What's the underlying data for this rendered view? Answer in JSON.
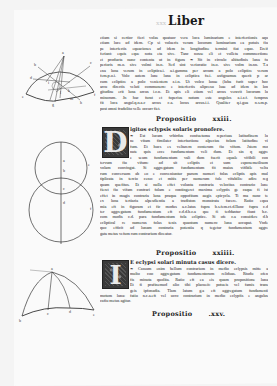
{
  "page": {
    "running_header": "Liber",
    "folio_ghost": "xxx"
  },
  "blocks": [
    {
      "id": "prop-xxii-tail",
      "lines": [
        "etiam si certior fieri volas quatuor vera loca luminarium e interfectionis aqu",
        "etiam luce ad idem. Cp si volueris veram locorum luminarium ea potuis fiu",
        "pe interfectis equaciones ad idem in longitudine termini fiat equo. Ereif",
        "feriant: equis eque nota eta sive. Tanc nosse eli et volleta commnectione",
        "et producta nunc contenta ut in figura ❧ Sit in circulo altitudinis luna fu",
        "perioris m.o. sive volmi in.n. Sed sint verioratio in.o. sive volm in.nn. T.a",
        "ena luna verum in ecliptica.i. a.i.gamma per arcum a polo ecliptice verum",
        "fem.p.o.i. Volo autem lune luna in ecliptica fu.i. asfignamus querit p ar",
        "cum ecliptice a polo venientem z.i.n. Ut volco lunae (luba furit super hoc",
        "arcu directis veluti communem: e interfectis alipcesu luae ad idem in lon",
        "gitudine erit luna arcus i.c.n. Et apis eli etiam vel arcus veravit locorum lu",
        "minorum. Jn hac furat et fuperius notum este angulos a.i.z.f. femprus",
        "fit loca angul.q.n.a.c arcus c.a. locus arcus.i.i. Qualiter q.i.gua n.s.m.p.",
        "post omni fradolito velle occurr fiet."
      ]
    }
  ],
  "propositions": [
    {
      "label": "Propositio",
      "number": "xxiii.",
      "subtitle": "igitos eclypsis solaris pronofere.",
      "initial": "D",
      "lines": [
        "❧ Est lucam vrbirdus confuetuma reperiuas latitudinem lu",
        "ne vitam fimilater interfactione alpecius folam latitudine vi",
        "fum. Et hucs es veltarem conterum fiu vifum. Jstem mo",
        "nute quis ecce fundamentum veli dum. Et sin q aggre",
        "e seum fundamentum vali dum fuerit equale vifibili con",
        "tervum fiu vifum: ad sit ecliptis et sum esponemetlisum",
        "volam convingat. Si aggregatum fundamentum fit maius vifibile velta",
        "rum conversum ab eo e conveniuntur parum numeri folas ecliptis apis mul",
        "tiplicata in tercio ceno: et mitis per numerum fole vifabilis: adire reg",
        "quam quefitus. Et si nulla effet volunta contraria velocitas contrario lune",
        "fieret fiu vifam contrari folam e contingeret maxima eclyptis ge caque fi ist",
        "effet in magis contraria luna praqua oppofitum augis epicycla. Ti ma nunc te",
        "ex luna tertiaria alpesdientia a tradiston monstrata facere. Ratio equa",
        "mia eft in figuram et fic modus a.c.latus fupra b.s.fem.ct.d.Ilunc fupra c.d",
        "ter aggregatum fundamentum eft c.d.d.b.c.a que fi teddantur fiunt b.c.",
        "com modis c.d. para fundamentum fola ecliptice. Si ofe c.a conuidere d.b",
        "ecliptical re numerus folas tenis quantum numero luna accupat. Vnde",
        "quo efficit ad lunam contraria potentia q tegetur fundamentum aggre",
        "gata metus vefum rum contrarium diceatur."
      ]
    },
    {
      "label": "Propositio",
      "number": "xxiiii.",
      "subtitle": "E eclypsi solari minuta casus dicere.",
      "initial": "I",
      "lines": [
        "❧ Cassum enim bellum contrarium in medio eclypsis mitte a",
        "multo coo aggregatum fundamentorum reliduas. Rtudu ofen",
        "fis minuta quolita. Ratio eft ea eis quam propositione luna",
        "Et fi prafinemud alio tibi placueit: potueis vel famis trans",
        "geis ipfonadia. Tlam latum g.a eft aggregatum fundamenti",
        "motum luna: fatiu n.c.a.eft vel ucro contrarium in medio eclypfis e angulus",
        "cafiu metus agitur."
      ]
    },
    {
      "label": "Propositio",
      "number": ".xxv."
    }
  ],
  "diagrams": [
    {
      "name": "semicircle-diagram",
      "labels": [
        "a",
        "b",
        "c",
        "d",
        "e",
        "f",
        "g",
        "h",
        "i",
        "k",
        "l",
        "m",
        "n",
        "o"
      ]
    },
    {
      "name": "intersecting-circles-diagram",
      "labels": [
        "a",
        "b",
        "c",
        "d",
        "e",
        "f"
      ]
    },
    {
      "name": "spherical-triangle-diagram",
      "labels": [
        "a",
        "b",
        "c",
        "d",
        "e"
      ]
    }
  ]
}
